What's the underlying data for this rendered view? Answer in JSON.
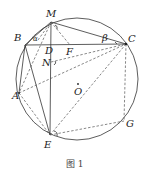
{
  "figure": {
    "caption": "图 1",
    "circle": {
      "cx": 77,
      "cy": 79,
      "r": 61
    },
    "points": {
      "M": {
        "label": "M",
        "x": 51,
        "y": 22
      },
      "B": {
        "label": "B",
        "x": 25,
        "y": 45
      },
      "D": {
        "label": "D",
        "x": 51,
        "y": 45
      },
      "F": {
        "label": "F",
        "x": 70,
        "y": 45
      },
      "C": {
        "label": "C",
        "x": 126,
        "y": 44
      },
      "N": {
        "label": "N",
        "x": 51,
        "y": 62
      },
      "A": {
        "label": "A",
        "x": 19,
        "y": 93
      },
      "O": {
        "label": "O",
        "x": 78,
        "y": 84
      },
      "E": {
        "label": "E",
        "x": 50,
        "y": 135
      },
      "G": {
        "label": "G",
        "x": 124,
        "y": 121
      }
    },
    "angle_labels": {
      "alpha": "α",
      "beta": "β"
    }
  }
}
